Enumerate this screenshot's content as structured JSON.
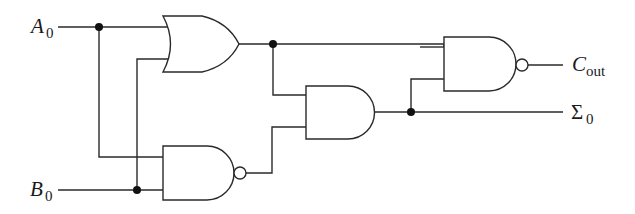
{
  "diagram": {
    "type": "logic-circuit",
    "inputs": [
      {
        "id": "A0",
        "main": "A",
        "sub": "0"
      },
      {
        "id": "B0",
        "main": "B",
        "sub": "0"
      }
    ],
    "outputs": [
      {
        "id": "Cout",
        "main": "C",
        "sub": "out"
      },
      {
        "id": "Sigma0",
        "main": "Σ",
        "sub": "0"
      }
    ],
    "gates": [
      {
        "id": "or1",
        "type": "OR",
        "inputs": [
          "A0",
          "B0"
        ],
        "output": "n1"
      },
      {
        "id": "nand1",
        "type": "NAND",
        "inputs": [
          "A0",
          "B0"
        ],
        "output": "n2"
      },
      {
        "id": "and1",
        "type": "AND",
        "inputs": [
          "n1",
          "n2"
        ],
        "output": "Sigma0"
      },
      {
        "id": "nand2",
        "type": "NAND",
        "inputs": [
          "n1",
          "Sigma0"
        ],
        "output": "Cout"
      }
    ],
    "colors": {
      "stroke": "#2a2a2a",
      "junction": "#111111",
      "background": "#ffffff"
    }
  }
}
